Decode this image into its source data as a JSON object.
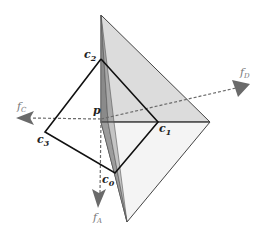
{
  "diagram": {
    "type": "geometric-3d",
    "colors": {
      "plane_light": "#dcdcdc",
      "plane_lower": "#f3f3f3",
      "plane_dark": "#8a8a8a",
      "plane_mid": "#b4b4b4",
      "edge": "#111111",
      "arrow": "#6a6a6a",
      "label": "#222222",
      "label_vector": "#777777"
    },
    "labels": {
      "c0": {
        "base": "c",
        "sub": "0"
      },
      "c1": {
        "base": "c",
        "sub": "1"
      },
      "c2": {
        "base": "c",
        "sub": "2"
      },
      "c3": {
        "base": "c",
        "sub": "3"
      },
      "p": "p",
      "fA": {
        "base": "f",
        "sub": "A"
      },
      "fC": {
        "base": "f",
        "sub": "C"
      },
      "fD": {
        "base": "f",
        "sub": "D"
      }
    },
    "points": {
      "c0": [
        115,
        173
      ],
      "c1": [
        158,
        122
      ],
      "c2": [
        101,
        59
      ],
      "c3": [
        45,
        132
      ],
      "p": [
        101,
        120
      ],
      "plane_top": [
        101,
        15
      ],
      "plane_right": [
        210,
        122
      ],
      "plane_bottom": [
        127,
        222
      ]
    }
  }
}
